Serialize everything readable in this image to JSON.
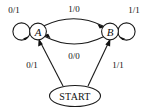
{
  "figure": {
    "type": "state-transition-diagram",
    "states": [
      {
        "id": "A",
        "label": "A"
      },
      {
        "id": "B",
        "label": "B"
      }
    ],
    "start_node": {
      "label": "START"
    },
    "transitions": [
      {
        "name": "self-loop-a",
        "from": "A",
        "to": "A",
        "label": "0/1",
        "position": "left-self-loop"
      },
      {
        "name": "self-loop-b",
        "from": "B",
        "to": "B",
        "label": "1/1",
        "position": "right-self-loop"
      },
      {
        "name": "a-to-b",
        "from": "A",
        "to": "B",
        "label": "1/0",
        "position": "top-arc"
      },
      {
        "name": "b-to-a",
        "from": "B",
        "to": "A",
        "label": "0/0",
        "position": "bottom-arc"
      },
      {
        "name": "start-to-a",
        "from": "START",
        "to": "A",
        "label": "0/1",
        "position": "left-diagonal"
      },
      {
        "name": "start-to-b",
        "from": "START",
        "to": "B",
        "label": "1/1",
        "position": "right-diagonal"
      }
    ],
    "colors": {
      "stroke": "#1a1a1a",
      "text": "#111111",
      "background": "#ffffff"
    }
  }
}
